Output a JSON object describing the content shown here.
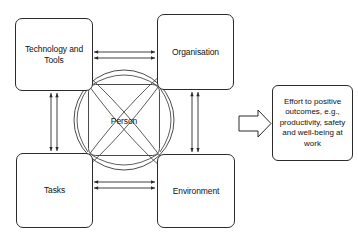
{
  "diagram": {
    "center": {
      "label": "Person"
    },
    "nodes": [
      {
        "id": "technology",
        "label": "Technology and\nTools",
        "position": "top-left"
      },
      {
        "id": "organisation",
        "label": "Organisation",
        "position": "top-right"
      },
      {
        "id": "tasks",
        "label": "Tasks",
        "position": "bottom-left"
      },
      {
        "id": "environment",
        "label": "Environment",
        "position": "bottom-right"
      }
    ],
    "callout": {
      "label": "Effort to positive outcomes, e.g., productivity, safety and well-being at work",
      "arrow_icon": "block-arrow-right-icon"
    },
    "connectors": {
      "top_pair": "double-headed-arrow-horizontal",
      "bottom_pair": "double-headed-arrow-horizontal",
      "left_pair": "double-headed-arrow-vertical",
      "right_pair": "double-headed-arrow-vertical",
      "diagonals": "curved-double-headed-arcs",
      "circle": "inscribed-circle",
      "inner_square": "rounded-inner-square"
    },
    "colors": {
      "stroke": "#2b2b2b",
      "text": "#111111",
      "background": "#ffffff",
      "thin_stroke": "#444444"
    }
  }
}
